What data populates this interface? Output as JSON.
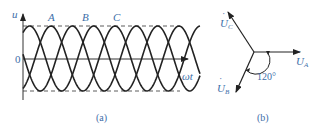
{
  "figure_a": {
    "y_axis_label": "u",
    "origin_label": "0",
    "x_axis_label": "ωt",
    "phase_labels": [
      "A",
      "B",
      "C"
    ],
    "caption": "(a)"
  },
  "figure_b": {
    "phasors": [
      {
        "name": "U",
        "subscript": "A",
        "angle_deg": 0
      },
      {
        "name": "U",
        "subscript": "B",
        "angle_deg": -120
      },
      {
        "name": "U",
        "subscript": "C",
        "angle_deg": 120
      }
    ],
    "angle_label": "120°",
    "caption": "(b)"
  },
  "colors": {
    "line": "#222222",
    "label": "#3d6ea8"
  }
}
